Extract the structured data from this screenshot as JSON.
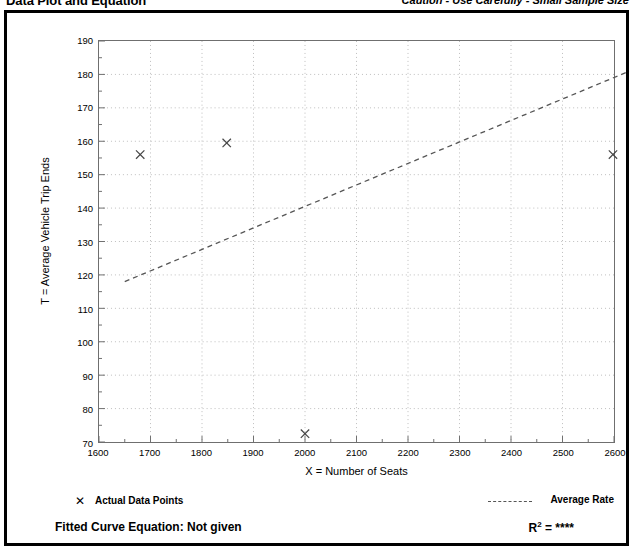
{
  "header": {
    "title": "Data Plot and Equation",
    "caution": "Caution - Use Carefully - Small Sample Size"
  },
  "legend": {
    "marker_glyph": "✕",
    "data_points_label": "Actual Data Points",
    "average_rate_label": "Average Rate",
    "equation_label": "Fitted Curve Equation:  Not given",
    "r2_prefix": "R",
    "r2_exponent": "2",
    "r2_value": " = ****"
  },
  "chart_data": {
    "type": "scatter",
    "title": "Data Plot and Equation",
    "subtitle": "Caution - Use Carefully - Small Sample Size",
    "xlabel": "X = Number of Seats",
    "ylabel": "T = Average Vehicle Trip Ends",
    "xlim": [
      1600,
      2600
    ],
    "ylim": [
      70,
      190
    ],
    "xticks": [
      1600,
      1700,
      1800,
      1900,
      2000,
      2100,
      2200,
      2300,
      2400,
      2500,
      2600
    ],
    "yticks": [
      70,
      80,
      90,
      100,
      110,
      120,
      130,
      140,
      150,
      160,
      170,
      180,
      190
    ],
    "xtick_labels": [
      "1600",
      "1700",
      "1800",
      "1900",
      "2000",
      "2100",
      "2200",
      "2300",
      "2400",
      "2500",
      "2600"
    ],
    "ytick_labels": [
      "70",
      "80",
      "90",
      "100",
      "110",
      "120",
      "130",
      "140",
      "150",
      "160",
      "170",
      "180",
      "190"
    ],
    "x_minor_step": 50,
    "y_minor_step": 5,
    "grid": true,
    "grid_style": "dotted",
    "grid_color": "#bdbdbd",
    "legend_position": "below-plot",
    "series": [
      {
        "name": "Actual Data Points",
        "type": "scatter",
        "marker": "x",
        "color": "#444444",
        "points": [
          {
            "x": 1680,
            "y": 156
          },
          {
            "x": 1848,
            "y": 159.5
          },
          {
            "x": 2000,
            "y": 72.5
          },
          {
            "x": 2598,
            "y": 156
          }
        ]
      },
      {
        "name": "Average Rate",
        "type": "line",
        "style": "dashed",
        "color": "#555555",
        "points": [
          {
            "x": 1650,
            "y": 118
          },
          {
            "x": 2630,
            "y": 181
          }
        ]
      }
    ],
    "annotations": {
      "fitted_curve_equation": "Not given",
      "r_squared": "****"
    }
  }
}
